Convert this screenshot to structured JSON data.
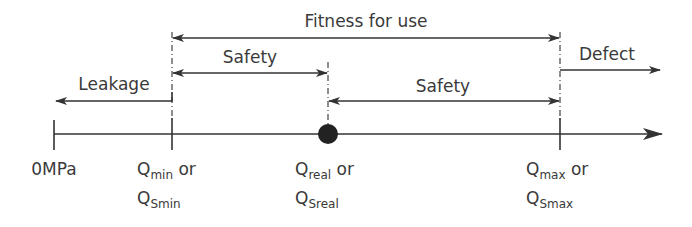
{
  "diagram": {
    "axis": {
      "origin_label": "0MPa",
      "points": [
        {
          "id": "qmin",
          "main": "Q",
          "sub": "min",
          "suffix": " or",
          "alt_main": "Q",
          "alt_sub": "Smin"
        },
        {
          "id": "qreal",
          "main": "Q",
          "sub": "real",
          "suffix": " or",
          "alt_main": "Q",
          "alt_sub": "Sreal"
        },
        {
          "id": "qmax",
          "main": "Q",
          "sub": "max",
          "suffix": " or",
          "alt_main": "Q",
          "alt_sub": "Smax"
        }
      ]
    },
    "ranges": {
      "fitness": "Fitness for use",
      "safety_left": "Safety",
      "safety_right": "Safety",
      "leakage": "Leakage",
      "defect": "Defect"
    },
    "colors": {
      "ink": "#333333"
    }
  }
}
